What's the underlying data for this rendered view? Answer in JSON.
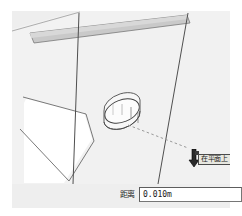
{
  "app": {
    "name": "SketchUp",
    "viewport_background": "#eeeeee",
    "face_fill": "#f1f1f1",
    "shaded_face_fill": "#c9c9c9",
    "edge_color": "#5a5a5a",
    "white_face_fill": "#ffffff"
  },
  "viewport": {
    "model_description": "Two rectangular volumes meeting at a corner with a small cylinder on the right face",
    "cylinder": {
      "name": "cylinder",
      "label": "cylinder-shape"
    },
    "inference": {
      "line_style": "dashed",
      "line_color": "#9a9a9a",
      "tooltip_text": "在平面上",
      "tooltip_name": "on-face-inference"
    },
    "cursor": {
      "tool": "push-pull-cursor"
    }
  },
  "measurements": {
    "label": "距离",
    "value": "0.010m",
    "placeholder": "0.010m"
  },
  "icons": {
    "cursor_arrow": "arrow-cursor-icon",
    "push_pull": "push-pull-icon"
  }
}
